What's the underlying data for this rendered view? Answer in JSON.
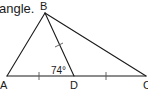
{
  "caption": "angle.",
  "figure": {
    "type": "triangle",
    "vertices": {
      "A": {
        "label": "A",
        "x": 7,
        "y": 76
      },
      "B": {
        "label": "B",
        "x": 45,
        "y": 13
      },
      "C": {
        "label": "C",
        "x": 146,
        "y": 76
      },
      "D": {
        "label": "D",
        "x": 74,
        "y": 76
      }
    },
    "segments": [
      "AB",
      "BC",
      "AC",
      "BD"
    ],
    "angle_label": "74°",
    "angle_at": "ADB",
    "congruence_marks": [
      "AD",
      "DC",
      "BD"
    ],
    "stroke_color": "#1a1a1a"
  }
}
